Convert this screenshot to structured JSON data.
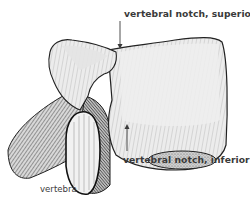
{
  "figure": {
    "illustration_style": "engraved line drawing",
    "colors": {
      "label_text": "#3a3a3a",
      "bone_fill": "#e9e9e9",
      "bone_shade": "#9a9a9a",
      "outline": "#1e1e1e",
      "background": "#ffffff"
    }
  },
  "labels": {
    "superior": "vertebral notch, superior",
    "inferior": "vertebral notch, inferior",
    "vertebra": "vertebra"
  },
  "leaders": {
    "superior": {
      "from": [
        120,
        21
      ],
      "to": [
        120,
        48
      ],
      "direction": "down"
    },
    "inferior": {
      "from": [
        127,
        151
      ],
      "to": [
        127,
        124
      ],
      "direction": "up"
    }
  }
}
